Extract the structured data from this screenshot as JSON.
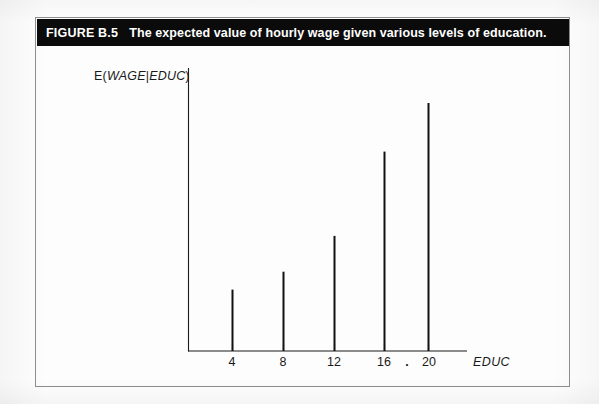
{
  "figure": {
    "number_label": "FIGURE B.5",
    "caption": "The expected value of hourly wage given various levels of education."
  },
  "axes": {
    "ylabel_prefix": "E(",
    "ylabel_var1": "WAGE",
    "ylabel_sep": "|",
    "ylabel_var2": "EDUC",
    "ylabel_suffix": ")",
    "ylabel_full": "E(WAGE|EDUC)",
    "xlabel": "EDUC",
    "ellipsis_mark": ".",
    "axis_color": "#111111"
  },
  "chart_data": {
    "type": "bar",
    "title": "The expected value of hourly wage given various levels of education.",
    "xlabel": "EDUC",
    "ylabel": "E(WAGE|EDUC)",
    "categories": [
      "4",
      "8",
      "12",
      "16",
      "20"
    ],
    "values": [
      2.4,
      3.1,
      4.5,
      7.8,
      9.7
    ],
    "x": [
      4,
      8,
      12,
      16,
      20
    ],
    "xlim": [
      0,
      24
    ],
    "ylim": [
      0,
      10
    ],
    "grid": false,
    "legend": false,
    "bar_style": "thin-vertical-stems",
    "bar_color": "#111111",
    "tick_labels_x": [
      "4",
      "8",
      "12",
      "16",
      "20"
    ],
    "tick_labels_y": [],
    "annotations": [
      {
        "text": ".",
        "x": 18,
        "y": 0,
        "note": "small dot between 16 and 20 tick labels"
      }
    ],
    "note": "Heights increase monotonically with education; y-axis has no numeric tick labels."
  }
}
